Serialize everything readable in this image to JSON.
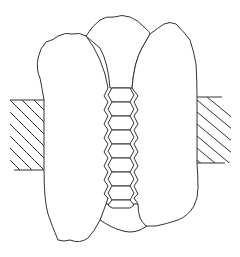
{
  "diagram": {
    "type": "line-drawing",
    "colors": {
      "stroke": "#333333",
      "background": "#ffffff"
    },
    "components": {
      "left_block": {
        "pattern": "diagonal-hatch",
        "x": 10,
        "y": 100,
        "width": 34,
        "height": 70
      },
      "right_block": {
        "pattern": "diagonal-hatch",
        "x": 197,
        "y": 97,
        "width": 34,
        "height": 66
      },
      "left_lobe": {
        "shape": "irregular-rounded"
      },
      "center_lobe": {
        "shape": "irregular-rounded"
      },
      "right_lobe": {
        "shape": "irregular-rounded"
      },
      "hex_column": {
        "cell_count": 9,
        "x_center": 121,
        "top": 88,
        "bottom": 204
      }
    }
  }
}
